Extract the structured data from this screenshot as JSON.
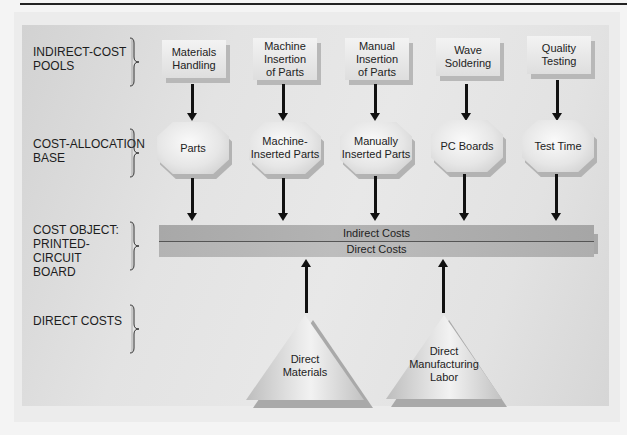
{
  "diagram": {
    "type": "flow",
    "row_labels": [
      {
        "id": "indirect_cost_pools",
        "lines": [
          "INDIRECT-COST",
          "POOLS"
        ]
      },
      {
        "id": "cost_allocation_base",
        "lines": [
          "COST-ALLOCATION",
          "BASE"
        ]
      },
      {
        "id": "cost_object",
        "lines": [
          "COST OBJECT:",
          "PRINTED-",
          "CIRCUIT",
          "BOARD"
        ]
      },
      {
        "id": "direct_costs",
        "lines": [
          "DIRECT COSTS"
        ]
      }
    ],
    "cost_pools": [
      {
        "lines": [
          "Materials",
          "Handling"
        ]
      },
      {
        "lines": [
          "Machine",
          "Insertion",
          "of Parts"
        ]
      },
      {
        "lines": [
          "Manual",
          "Insertion",
          "of Parts"
        ]
      },
      {
        "lines": [
          "Wave",
          "Soldering"
        ]
      },
      {
        "lines": [
          "Quality",
          "Testing"
        ]
      }
    ],
    "allocation_bases": [
      {
        "lines": [
          "Parts"
        ]
      },
      {
        "lines": [
          "Machine-",
          "Inserted Parts"
        ]
      },
      {
        "lines": [
          "Manually",
          "Inserted Parts"
        ]
      },
      {
        "lines": [
          "PC Boards"
        ]
      },
      {
        "lines": [
          "Test Time"
        ]
      }
    ],
    "cost_object_bar": {
      "top_label": "Indirect Costs",
      "bottom_label": "Direct Costs"
    },
    "direct_cost_sources": [
      {
        "lines": [
          "Direct",
          "Materials"
        ]
      },
      {
        "lines": [
          "Direct",
          "Manufacturing",
          "Labor"
        ]
      }
    ],
    "edges": [
      {
        "from": "Materials Handling",
        "to": "Parts"
      },
      {
        "from": "Machine Insertion of Parts",
        "to": "Machine-Inserted Parts"
      },
      {
        "from": "Manual Insertion of Parts",
        "to": "Manually Inserted Parts"
      },
      {
        "from": "Wave Soldering",
        "to": "PC Boards"
      },
      {
        "from": "Quality Testing",
        "to": "Test Time"
      },
      {
        "from": "Parts",
        "to": "Indirect Costs"
      },
      {
        "from": "Machine-Inserted Parts",
        "to": "Indirect Costs"
      },
      {
        "from": "Manually Inserted Parts",
        "to": "Indirect Costs"
      },
      {
        "from": "PC Boards",
        "to": "Indirect Costs"
      },
      {
        "from": "Test Time",
        "to": "Indirect Costs"
      },
      {
        "from": "Direct Materials",
        "to": "Direct Costs"
      },
      {
        "from": "Direct Manufacturing Labor",
        "to": "Direct Costs"
      }
    ]
  }
}
